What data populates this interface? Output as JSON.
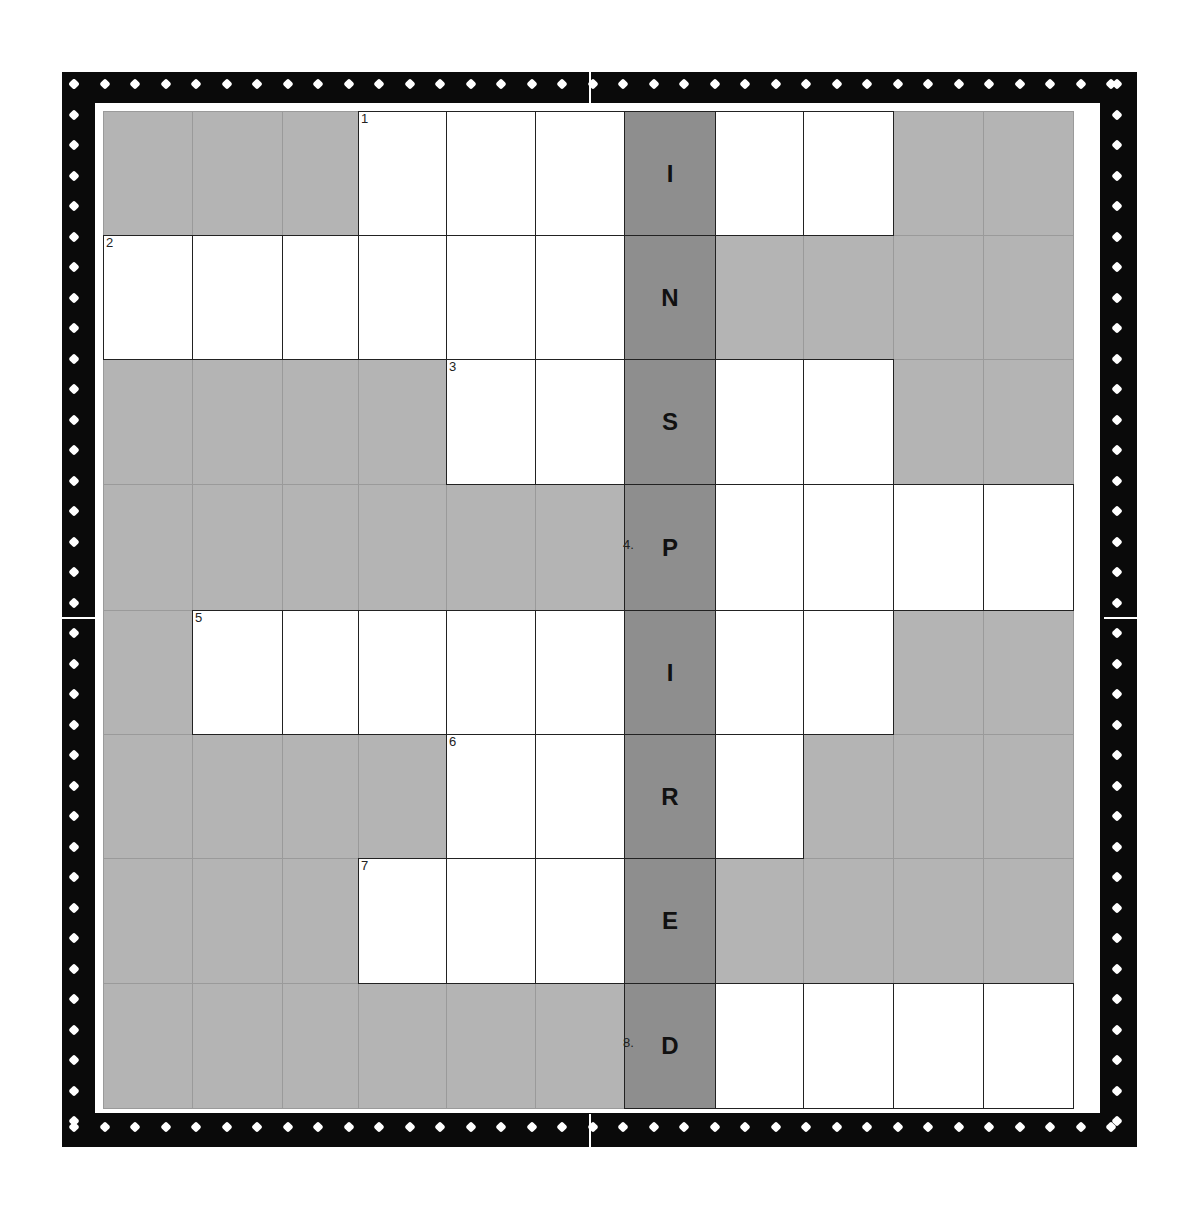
{
  "puzzle": {
    "keyword": "INSPIRED",
    "rows": 8,
    "cols": 11,
    "col_edges": [
      103,
      192,
      282,
      358,
      446,
      535,
      624,
      715,
      803,
      893,
      983,
      1073
    ],
    "row_edges": [
      111,
      235,
      359,
      484,
      610,
      734,
      858,
      983,
      1108
    ],
    "key_column": 6,
    "colors": {
      "block": "#b4b4b4",
      "key_column": "#8e8e8e",
      "white": "#ffffff",
      "frame": "#0a0a0a",
      "grid_line": "#222222"
    },
    "entries": [
      {
        "number": "1",
        "row": 0,
        "start_col": 3,
        "end_col": 8,
        "key_letter": "I"
      },
      {
        "number": "2",
        "row": 1,
        "start_col": 0,
        "end_col": 6,
        "key_letter": "N"
      },
      {
        "number": "3",
        "row": 2,
        "start_col": 4,
        "end_col": 8,
        "key_letter": "S"
      },
      {
        "number": "4.",
        "row": 3,
        "start_col": 6,
        "end_col": 10,
        "key_letter": "P"
      },
      {
        "number": "5",
        "row": 4,
        "start_col": 1,
        "end_col": 8,
        "key_letter": "I"
      },
      {
        "number": "6",
        "row": 5,
        "start_col": 4,
        "end_col": 7,
        "key_letter": "R"
      },
      {
        "number": "7",
        "row": 6,
        "start_col": 3,
        "end_col": 6,
        "key_letter": "E"
      },
      {
        "number": "8.",
        "row": 7,
        "start_col": 6,
        "end_col": 10,
        "key_letter": "D"
      }
    ]
  }
}
